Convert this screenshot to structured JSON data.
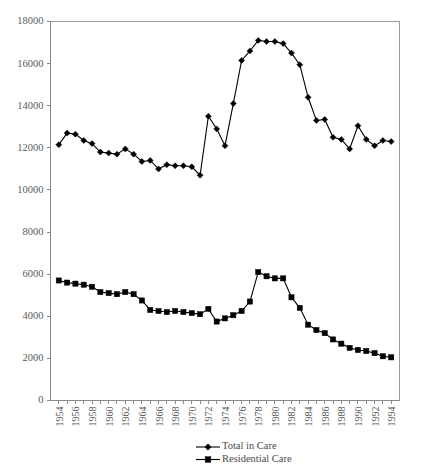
{
  "chart_data": {
    "type": "line",
    "title": "",
    "subtitle": "",
    "xlabel": "",
    "ylabel": "",
    "xlim": [
      1954,
      1995
    ],
    "ylim": [
      0,
      18000
    ],
    "y_ticks": [
      0,
      2000,
      4000,
      6000,
      8000,
      10000,
      12000,
      14000,
      16000,
      18000
    ],
    "x_tick_labels": [
      "1954",
      "1956",
      "1958",
      "1960",
      "1962",
      "1964",
      "1966",
      "1968",
      "1970",
      "1972",
      "1974",
      "1976",
      "1978",
      "1980",
      "1982",
      "1984",
      "1986",
      "1988",
      "1990",
      "1992",
      "1994"
    ],
    "grid": false,
    "legend_position": "bottom",
    "x": [
      1954,
      1955,
      1956,
      1957,
      1958,
      1959,
      1960,
      1961,
      1962,
      1963,
      1964,
      1965,
      1966,
      1967,
      1968,
      1969,
      1970,
      1971,
      1972,
      1973,
      1974,
      1975,
      1976,
      1977,
      1978,
      1979,
      1980,
      1981,
      1982,
      1983,
      1984,
      1985,
      1986,
      1987,
      1988,
      1989,
      1990,
      1991,
      1992,
      1993,
      1994
    ],
    "series": [
      {
        "name": "Total in Care",
        "marker": "diamond",
        "color": "#000000",
        "values": [
          12150,
          12700,
          12650,
          12350,
          12200,
          11800,
          11750,
          11700,
          11950,
          11700,
          11350,
          11400,
          11000,
          11200,
          11150,
          11150,
          11100,
          10700,
          13500,
          12900,
          12100,
          14100,
          16150,
          16600,
          17100,
          17050,
          17050,
          16950,
          16500,
          15950,
          14400,
          13300,
          13350,
          12500,
          12400,
          11950,
          13050,
          12400,
          12100,
          12350,
          12300
        ]
      },
      {
        "name": "Residential Care",
        "marker": "square",
        "color": "#000000",
        "values": [
          5700,
          5600,
          5550,
          5500,
          5400,
          5150,
          5100,
          5050,
          5150,
          5050,
          4750,
          4300,
          4250,
          4200,
          4250,
          4200,
          4150,
          4100,
          4350,
          3750,
          3900,
          4050,
          4250,
          4700,
          6100,
          5900,
          5800,
          5800,
          4900,
          4400,
          3600,
          3350,
          3200,
          2900,
          2700,
          2500,
          2400,
          2350,
          2250,
          2100,
          2050
        ]
      }
    ]
  },
  "legend": {
    "items": [
      {
        "label": "Total in Care",
        "marker": "diamond"
      },
      {
        "label": "Residential Care",
        "marker": "square"
      }
    ]
  }
}
